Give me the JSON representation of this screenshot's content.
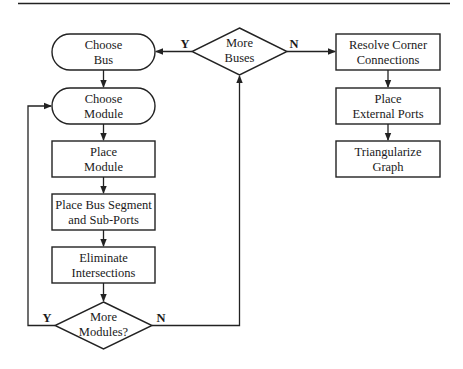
{
  "diagram": {
    "type": "flowchart",
    "nodes": {
      "choose_bus": {
        "line1": "Choose",
        "line2": "Bus"
      },
      "choose_module": {
        "line1": "Choose",
        "line2": "Module"
      },
      "place_module": {
        "line1": "Place",
        "line2": "Module"
      },
      "place_bus_segment": {
        "line1": "Place Bus Segment",
        "line2": "and Sub-Ports"
      },
      "eliminate_intersections": {
        "line1": "Eliminate",
        "line2": "Intersections"
      },
      "more_modules": {
        "line1": "More",
        "line2": "Modules?"
      },
      "more_buses": {
        "line1": "More",
        "line2": "Buses"
      },
      "resolve_corner": {
        "line1": "Resolve Corner",
        "line2": "Connections"
      },
      "place_external_ports": {
        "line1": "Place",
        "line2": "External Ports"
      },
      "triangularize_graph": {
        "line1": "Triangularize",
        "line2": "Graph"
      }
    },
    "edge_labels": {
      "more_buses_yes": "Y",
      "more_buses_no": "N",
      "more_modules_yes": "Y",
      "more_modules_no": "N"
    },
    "edges": [
      {
        "from": "choose_bus",
        "to": "choose_module"
      },
      {
        "from": "choose_module",
        "to": "place_module"
      },
      {
        "from": "place_module",
        "to": "place_bus_segment"
      },
      {
        "from": "place_bus_segment",
        "to": "eliminate_intersections"
      },
      {
        "from": "eliminate_intersections",
        "to": "more_modules"
      },
      {
        "from": "more_modules",
        "to": "choose_module",
        "label": "Y"
      },
      {
        "from": "more_modules",
        "to": "more_buses",
        "label": "N"
      },
      {
        "from": "more_buses",
        "to": "choose_bus",
        "label": "Y"
      },
      {
        "from": "more_buses",
        "to": "resolve_corner",
        "label": "N"
      },
      {
        "from": "resolve_corner",
        "to": "place_external_ports"
      },
      {
        "from": "place_external_ports",
        "to": "triangularize_graph"
      }
    ]
  }
}
